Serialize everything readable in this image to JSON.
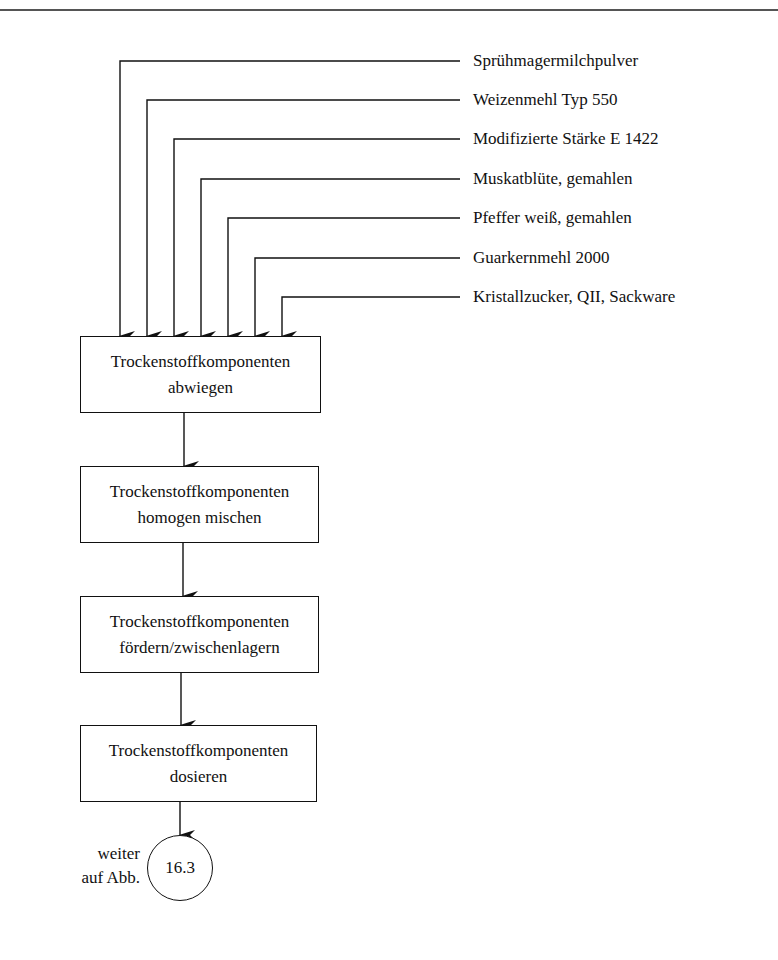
{
  "diagram": {
    "inputs": [
      {
        "label": "Sprühmagermilchpulver"
      },
      {
        "label": "Weizenmehl Typ 550"
      },
      {
        "label": "Modifizierte Stärke E 1422"
      },
      {
        "label": "Muskatblüte, gemahlen"
      },
      {
        "label": "Pfeffer weiß, gemahlen"
      },
      {
        "label": "Guarkernmehl 2000"
      },
      {
        "label": "Kristallzucker, QII, Sackware"
      }
    ],
    "steps": [
      {
        "line1": "Trockenstoffkomponenten",
        "line2": "abwiegen"
      },
      {
        "line1": "Trockenstoffkomponenten",
        "line2": "homogen mischen"
      },
      {
        "line1": "Trockenstoffkomponenten",
        "line2": "fördern/zwischenlagern"
      },
      {
        "line1": "Trockenstoffkomponenten",
        "line2": "dosieren"
      }
    ],
    "connector": {
      "label": "16.3",
      "note_line1": "weiter",
      "note_line2": "auf Abb."
    }
  }
}
